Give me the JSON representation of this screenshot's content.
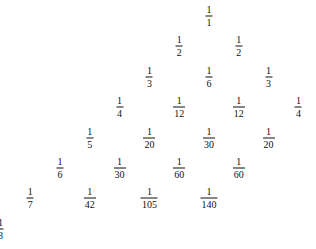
{
  "rows": [
    [
      {
        "n": "1",
        "d": "1"
      }
    ],
    [
      {
        "n": "1",
        "d": "2"
      },
      {
        "n": "1",
        "d": "2"
      }
    ],
    [
      {
        "n": "1",
        "d": "3"
      },
      {
        "n": "1",
        "d": "6"
      },
      {
        "n": "1",
        "d": "3"
      }
    ],
    [
      {
        "n": "1",
        "d": "4"
      },
      {
        "n": "1",
        "d": "12"
      },
      {
        "n": "1",
        "d": "12"
      },
      {
        "n": "1",
        "d": "4"
      }
    ],
    [
      {
        "n": "1",
        "d": "5"
      },
      {
        "n": "1",
        "d": "20"
      },
      {
        "n": "1",
        "d": "30"
      },
      {
        "n": "1",
        "d": "20"
      }
    ],
    [
      {
        "n": "1",
        "d": "6"
      },
      {
        "n": "1",
        "d": "30"
      },
      {
        "n": "1",
        "d": "60"
      },
      {
        "n": "1",
        "d": "60"
      }
    ],
    [
      {
        "n": "1",
        "d": "7"
      },
      {
        "n": "1",
        "d": "42"
      },
      {
        "n": "1",
        "d": "105"
      },
      {
        "n": "1",
        "d": "140"
      }
    ],
    [
      {
        "n": "1",
        "d": "8"
      }
    ]
  ]
}
